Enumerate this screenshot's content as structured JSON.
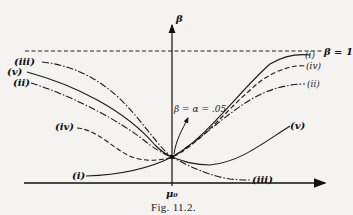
{
  "figure": {
    "caption": "Fig. 11.2.",
    "y_axis_label": "β",
    "x_axis_label": "μ₀",
    "asymptote_label": "β = 1",
    "annotation": "β = α = .05",
    "curves": [
      {
        "id": "i",
        "label": "(i)",
        "style": "solid",
        "left_end": "low",
        "right_end": "high"
      },
      {
        "id": "ii",
        "label": "(ii)",
        "style": "dash-dot",
        "left_end": "high",
        "right_end": "medium"
      },
      {
        "id": "iii",
        "label": "(iii)",
        "style": "dash-dot",
        "left_end": "high",
        "right_end": "low"
      },
      {
        "id": "iv",
        "label": "(iv)",
        "style": "dashed",
        "left_end": "medium",
        "right_end": "high"
      },
      {
        "id": "v",
        "label": "(v)",
        "style": "solid",
        "left_end": "high",
        "right_end": "medium"
      }
    ],
    "labels": {
      "i_left": "(i)",
      "i_right": "(i)",
      "ii_left": "(ii)",
      "ii_right": "(ii)",
      "iii_left": "(iii)",
      "iii_right": "(iii)",
      "iv_left": "(iv)",
      "iv_right": "(iv)",
      "v_left": "(v)",
      "v_right": "(v)"
    }
  }
}
